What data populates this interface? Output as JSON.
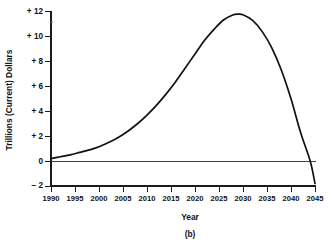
{
  "chart_data": {
    "type": "line",
    "title": "",
    "caption": "(b)",
    "xlabel": "Year",
    "ylabel": "Trillions (Current) Dollars",
    "xlim": [
      1990,
      2045
    ],
    "ylim": [
      -2,
      12
    ],
    "grid": false,
    "legend": "none",
    "x_ticks": [
      1990,
      1995,
      2000,
      2005,
      2010,
      2015,
      2020,
      2025,
      2030,
      2035,
      2040,
      2045
    ],
    "x_tick_labels": [
      "1990",
      "1995",
      "2000",
      "2005",
      "2010",
      "2015",
      "2020",
      "2025",
      "2030",
      "2035",
      "2040",
      "2045"
    ],
    "y_ticks": [
      -2,
      0,
      2,
      4,
      6,
      8,
      10,
      12
    ],
    "y_tick_labels": [
      "− 2",
      "0",
      "+ 2",
      "+ 4",
      "+ 6",
      "+ 8",
      "+ 10",
      "+ 12"
    ],
    "series": [
      {
        "name": "projected balance",
        "color": "#111111",
        "x": [
          1990,
          1992,
          1994,
          1996,
          1998,
          2000,
          2002,
          2004,
          2006,
          2008,
          2010,
          2012,
          2014,
          2016,
          2018,
          2020,
          2022,
          2024,
          2026,
          2028,
          2029,
          2030,
          2032,
          2034,
          2036,
          2038,
          2040,
          2042,
          2044,
          2045
        ],
        "y": [
          0.2,
          0.35,
          0.5,
          0.7,
          0.9,
          1.15,
          1.5,
          1.9,
          2.4,
          3.0,
          3.7,
          4.5,
          5.4,
          6.4,
          7.5,
          8.6,
          9.7,
          10.6,
          11.35,
          11.75,
          11.8,
          11.75,
          11.3,
          10.4,
          9.1,
          7.3,
          5.0,
          2.3,
          0.0,
          -1.8
        ]
      }
    ],
    "annotations": {
      "peak_year": 2029,
      "peak_value": 11.8,
      "start_value": 0.2,
      "end_value": -1.8,
      "zero_crossing_year": 2044
    }
  },
  "figure": {
    "caption": "(b)"
  }
}
